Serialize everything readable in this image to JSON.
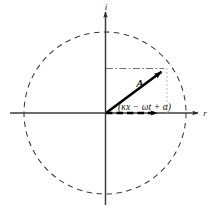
{
  "figure": {
    "kind": "phasor-argand-diagram",
    "background_color": "#ffffff",
    "ink_color": "#1a1a1a",
    "width_px": 216,
    "height_px": 218
  },
  "axes": {
    "imaginary_axis_label": "i",
    "real_axis_label": "r",
    "origin": {
      "x": 105,
      "y": 113
    }
  },
  "circle": {
    "center_x": 105,
    "center_y": 113,
    "radius": 81,
    "style": "dashed",
    "color": "#3a3a3a"
  },
  "vector": {
    "label": "A",
    "tip_x": 166,
    "tip_y": 68,
    "style": "solid-thick-arrow",
    "color": "#000000"
  },
  "reference_arrow": {
    "label": "",
    "tip_x": 163,
    "tip_y": 113,
    "style": "dashed-thick-arrow",
    "color": "#000000"
  },
  "projection_lines": {
    "horizontal": {
      "from_x": 106,
      "to_x": 166,
      "y": 68,
      "style": "dash-dot",
      "color": "#666666"
    },
    "vertical": {
      "x": 166,
      "from_y": 68,
      "to_y": 113,
      "style": "dotted",
      "color": "#999999"
    }
  },
  "annotations": {
    "phase_angle": "(κx − ωt + α)",
    "amplitude": "A"
  }
}
